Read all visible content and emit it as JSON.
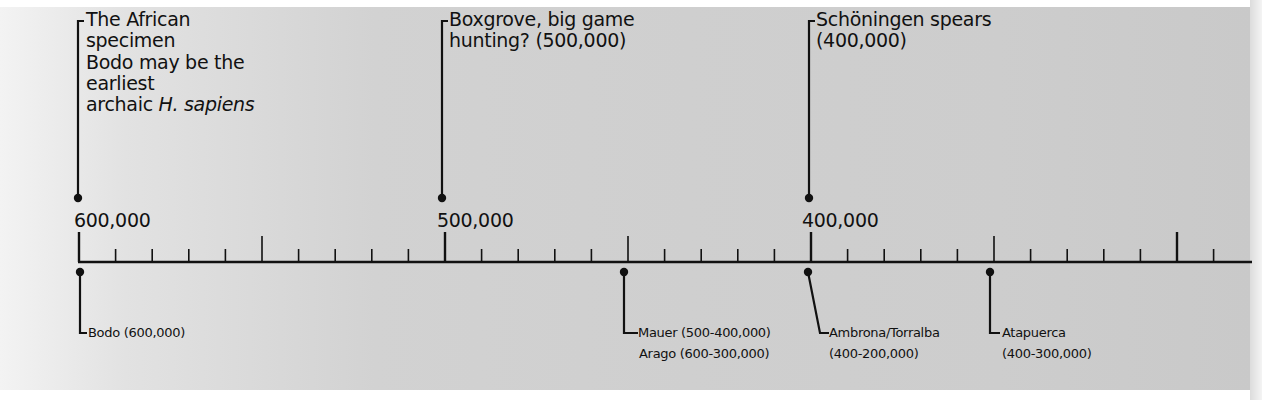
{
  "timeline": {
    "axis": {
      "labels": [
        {
          "text": "600,000",
          "value": 600000
        },
        {
          "text": "500,000",
          "value": 500000
        },
        {
          "text": "400,000",
          "value": 400000
        }
      ],
      "range_start": 600000,
      "range_end_visible": 280000,
      "minor_tick_interval": 10000,
      "mid_tick_interval": 50000,
      "major_tick_interval": 100000
    },
    "events_above": [
      {
        "date": 600000,
        "lines": [
          "The African",
          "specimen",
          "Bodo may be the",
          "earliest"
        ],
        "last_line_plain": "archaic ",
        "last_line_italic": "H. sapiens"
      },
      {
        "date": 500000,
        "lines": [
          "Boxgrove, big game",
          "hunting? (500,000)"
        ]
      },
      {
        "date": 400000,
        "lines": [
          "Schöningen spears",
          "(400,000)"
        ]
      }
    ],
    "events_below": [
      {
        "date": 600000,
        "lines": [
          "Bodo (600,000)"
        ]
      },
      {
        "date": 450000,
        "lines": [
          "Mauer (500-400,000)",
          "Arago (600-300,000)"
        ]
      },
      {
        "date": 400000,
        "lines": [
          "Ambrona/Torralba",
          "(400-200,000)"
        ]
      },
      {
        "date": 350000,
        "lines": [
          "Atapuerca",
          "(400-300,000)"
        ]
      }
    ]
  },
  "colors": {
    "ink": "#111111",
    "panel": "#cfcfcf",
    "panel_light": "#f3f3f3",
    "background": "#ffffff"
  }
}
